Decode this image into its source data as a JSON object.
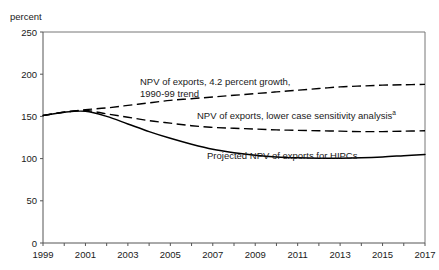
{
  "figure": {
    "title": "",
    "width": 439,
    "height": 270,
    "background": "#ffffff"
  },
  "annotations": {
    "growth_line1": "NPV of exports, 4.2 percent growth,",
    "growth_line2": "1990-99 trend",
    "lower_case": "NPV of exports, lower case sensitivity analysis",
    "lower_case_footnote": "a",
    "hipc": "Projected NPV of exports for HIPCs"
  },
  "chart_data": {
    "type": "line",
    "title": "",
    "xlabel": "",
    "ylabel": "percent",
    "ylim": [
      0,
      250
    ],
    "xlim": [
      1999,
      2017
    ],
    "grid": false,
    "legend": "annotations-inline",
    "ytick_labels": [
      "0",
      "50",
      "100",
      "150",
      "200",
      "250"
    ],
    "yticks": [
      0,
      50,
      100,
      150,
      200,
      250
    ],
    "xtick_labels": [
      "1999",
      "2001",
      "2003",
      "2005",
      "2007",
      "2009",
      "2011",
      "2013",
      "2015",
      "2017"
    ],
    "xticks": [
      1999,
      2001,
      2003,
      2005,
      2007,
      2009,
      2011,
      2013,
      2015,
      2017
    ],
    "x": [
      1999,
      2000,
      2001,
      2002,
      2003,
      2004,
      2005,
      2006,
      2007,
      2008,
      2009,
      2010,
      2011,
      2012,
      2013,
      2014,
      2015,
      2016,
      2017
    ],
    "series": [
      {
        "name": "NPV of exports, 4.2 percent growth, 1990-99 trend",
        "style": "dashed",
        "color": "#000000",
        "values": [
          151,
          155,
          158,
          160,
          163,
          166,
          169,
          171,
          173,
          175,
          177,
          179,
          181,
          183,
          185,
          186,
          187,
          187.5,
          188
        ]
      },
      {
        "name": "NPV of exports, lower case sensitivity analysis",
        "style": "dashed",
        "color": "#000000",
        "values": [
          151,
          155,
          157,
          153,
          149,
          145,
          142,
          139,
          137,
          136,
          135,
          134,
          133.5,
          133,
          132.5,
          132,
          132,
          132.5,
          133
        ]
      },
      {
        "name": "Projected NPV of exports for HIPCs",
        "style": "solid",
        "color": "#000000",
        "values": [
          151,
          155,
          156,
          150,
          141,
          132,
          124,
          117,
          111,
          107,
          104,
          102,
          101,
          100.5,
          100.5,
          101,
          102,
          103.5,
          105
        ]
      }
    ]
  }
}
